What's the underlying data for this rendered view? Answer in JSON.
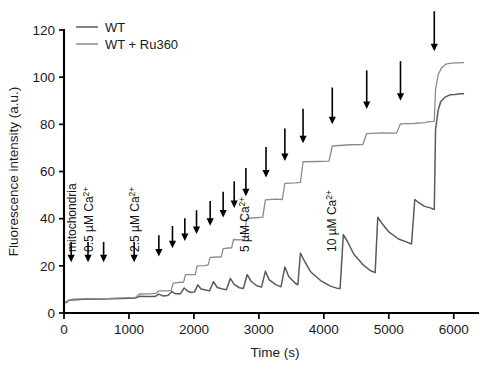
{
  "chart_data": {
    "type": "line",
    "title": "",
    "xlabel": "Time (s)",
    "ylabel": "Fluorescence intensity (a.u.)",
    "xlim": [
      0,
      6250
    ],
    "ylim": [
      0,
      120
    ],
    "xticks": [
      0,
      1000,
      2000,
      3000,
      4000,
      5000,
      6000
    ],
    "yticks": [
      0,
      20,
      40,
      60,
      80,
      100,
      120
    ],
    "grid": false,
    "legend_position": "top-left",
    "series": [
      {
        "name": "WT",
        "color": "#5a5a5a",
        "description": "Sawtooth Ca2+ uptake trace: each pulse spikes then decays as mitochondria take up calcium",
        "points": [
          [
            0,
            4.4
          ],
          [
            40,
            4.6
          ],
          [
            80,
            5.4
          ],
          [
            130,
            5.6
          ],
          [
            300,
            5.7
          ],
          [
            600,
            5.9
          ],
          [
            900,
            6.1
          ],
          [
            1100,
            6.4
          ],
          [
            1160,
            7.2
          ],
          [
            1250,
            6.9
          ],
          [
            1400,
            7.0
          ],
          [
            1460,
            7.8
          ],
          [
            1520,
            7.3
          ],
          [
            1600,
            7.4
          ],
          [
            1660,
            9.2
          ],
          [
            1720,
            8.2
          ],
          [
            1790,
            8.0
          ],
          [
            1850,
            10.6
          ],
          [
            1900,
            9.2
          ],
          [
            1960,
            8.8
          ],
          [
            2010,
            9.0
          ],
          [
            2060,
            12.0
          ],
          [
            2110,
            10.2
          ],
          [
            2180,
            9.6
          ],
          [
            2240,
            9.4
          ],
          [
            2300,
            13.2
          ],
          [
            2360,
            11.0
          ],
          [
            2440,
            10.2
          ],
          [
            2500,
            9.9
          ],
          [
            2560,
            14.6
          ],
          [
            2620,
            12.0
          ],
          [
            2700,
            10.8
          ],
          [
            2760,
            10.4
          ],
          [
            2820,
            16.4
          ],
          [
            2880,
            13.4
          ],
          [
            2960,
            11.6
          ],
          [
            3040,
            10.9
          ],
          [
            3100,
            17.6
          ],
          [
            3160,
            14.2
          ],
          [
            3260,
            12.0
          ],
          [
            3340,
            11.2
          ],
          [
            3400,
            19.4
          ],
          [
            3460,
            15.4
          ],
          [
            3560,
            12.6
          ],
          [
            3600,
            12.0
          ],
          [
            3640,
            25.6
          ],
          [
            3700,
            22.0
          ],
          [
            3800,
            17.4
          ],
          [
            3950,
            13.6
          ],
          [
            4100,
            11.4
          ],
          [
            4200,
            10.6
          ],
          [
            4250,
            10.4
          ],
          [
            4300,
            33.4
          ],
          [
            4360,
            30.4
          ],
          [
            4460,
            25.0
          ],
          [
            4600,
            20.4
          ],
          [
            4720,
            18.0
          ],
          [
            4790,
            17.2
          ],
          [
            4830,
            40.6
          ],
          [
            4890,
            38.2
          ],
          [
            5000,
            34.2
          ],
          [
            5150,
            31.4
          ],
          [
            5280,
            30.0
          ],
          [
            5350,
            29.4
          ],
          [
            5400,
            48.2
          ],
          [
            5450,
            47.0
          ],
          [
            5550,
            45.2
          ],
          [
            5640,
            44.4
          ],
          [
            5680,
            44.2
          ],
          [
            5700,
            44.0
          ],
          [
            5720,
            78.0
          ],
          [
            5760,
            86.0
          ],
          [
            5800,
            89.6
          ],
          [
            5860,
            91.4
          ],
          [
            5940,
            92.4
          ],
          [
            6020,
            92.8
          ],
          [
            6100,
            93.0
          ],
          [
            6150,
            93.0
          ]
        ]
      },
      {
        "name": "WT + Ru360",
        "color": "#8c8c8c",
        "description": "Staircase trace: calcium accumulates in buffer without mitochondrial uptake",
        "points": [
          [
            0,
            4.6
          ],
          [
            40,
            4.8
          ],
          [
            80,
            5.6
          ],
          [
            140,
            5.8
          ],
          [
            400,
            6.0
          ],
          [
            700,
            6.2
          ],
          [
            1000,
            6.5
          ],
          [
            1100,
            6.8
          ],
          [
            1160,
            8.0
          ],
          [
            1300,
            8.1
          ],
          [
            1420,
            8.2
          ],
          [
            1460,
            9.4
          ],
          [
            1600,
            9.5
          ],
          [
            1650,
            9.6
          ],
          [
            1680,
            12.8
          ],
          [
            1800,
            12.9
          ],
          [
            1840,
            13.0
          ],
          [
            1870,
            16.2
          ],
          [
            1980,
            16.3
          ],
          [
            2020,
            16.4
          ],
          [
            2050,
            20.0
          ],
          [
            2160,
            20.1
          ],
          [
            2220,
            20.2
          ],
          [
            2250,
            23.6
          ],
          [
            2360,
            23.7
          ],
          [
            2420,
            23.8
          ],
          [
            2450,
            27.4
          ],
          [
            2540,
            27.5
          ],
          [
            2580,
            27.6
          ],
          [
            2610,
            31.0
          ],
          [
            2720,
            31.1
          ],
          [
            2780,
            31.2
          ],
          [
            2810,
            40.2
          ],
          [
            2960,
            40.4
          ],
          [
            3060,
            40.5
          ],
          [
            3100,
            48.0
          ],
          [
            3260,
            48.2
          ],
          [
            3360,
            48.3
          ],
          [
            3400,
            55.0
          ],
          [
            3560,
            55.2
          ],
          [
            3640,
            55.3
          ],
          [
            3680,
            64.0
          ],
          [
            3900,
            64.3
          ],
          [
            4080,
            64.4
          ],
          [
            4130,
            71.0
          ],
          [
            4400,
            71.3
          ],
          [
            4600,
            71.4
          ],
          [
            4660,
            76.0
          ],
          [
            4900,
            76.3
          ],
          [
            5120,
            76.4
          ],
          [
            5180,
            80.2
          ],
          [
            5380,
            80.5
          ],
          [
            5560,
            80.6
          ],
          [
            5600,
            81.0
          ],
          [
            5680,
            81.2
          ],
          [
            5700,
            81.4
          ],
          [
            5720,
            95.0
          ],
          [
            5760,
            101.0
          ],
          [
            5810,
            104.0
          ],
          [
            5880,
            105.4
          ],
          [
            5960,
            105.9
          ],
          [
            6050,
            106.1
          ],
          [
            6150,
            106.2
          ]
        ]
      }
    ],
    "annotations": [
      {
        "label": "mitochondria",
        "x": 110,
        "sup": ""
      },
      {
        "label": "0.5 µM Ca",
        "x": 370,
        "sup": "2+"
      },
      {
        "label": "2.5 µM Ca",
        "x": 1080,
        "sup": "2+"
      },
      {
        "label": "5 µM Ca",
        "x": 2780,
        "sup": "2+"
      },
      {
        "label": "10 µM Ca",
        "x": 4120,
        "sup": "2+"
      }
    ],
    "arrows": [
      {
        "x": 110,
        "y_tip": 21.5
      },
      {
        "x": 370,
        "y_tip": 21.5
      },
      {
        "x": 610,
        "y_tip": 21.5
      },
      {
        "x": 1080,
        "y_tip": 21.5
      },
      {
        "x": 1460,
        "y_tip": 24.0
      },
      {
        "x": 1670,
        "y_tip": 27.5
      },
      {
        "x": 1860,
        "y_tip": 30.5
      },
      {
        "x": 2040,
        "y_tip": 33.5
      },
      {
        "x": 2250,
        "y_tip": 37.0
      },
      {
        "x": 2450,
        "y_tip": 40.5
      },
      {
        "x": 2620,
        "y_tip": 44.5
      },
      {
        "x": 2800,
        "y_tip": 49.5
      },
      {
        "x": 3110,
        "y_tip": 57.5
      },
      {
        "x": 3400,
        "y_tip": 64.5
      },
      {
        "x": 3680,
        "y_tip": 72.0
      },
      {
        "x": 4130,
        "y_tip": 80.0
      },
      {
        "x": 4660,
        "y_tip": 86.5
      },
      {
        "x": 5180,
        "y_tip": 90.0
      },
      {
        "x": 5700,
        "y_tip": 111.0
      }
    ]
  },
  "legend": {
    "entries": [
      {
        "label": "WT",
        "color": "#5a5a5a"
      },
      {
        "label": "WT + Ru360",
        "color": "#8c8c8c"
      }
    ]
  },
  "caption": {
    "text": ""
  }
}
